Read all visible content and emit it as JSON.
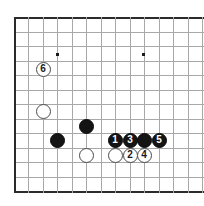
{
  "figure": {
    "name": "go-board-diagram",
    "width": 204,
    "height": 206,
    "background_color": "#ffffff",
    "grid_line_color": "#a8a8a8",
    "border_line_color": "#2b2b2b",
    "black_stone_color": "#141414",
    "white_stone_color": "#ffffff",
    "star_point_color": "#1a1a1a",
    "grid_spacing": 14.5,
    "grid_origin_x": 14,
    "grid_origin_y": 17,
    "columns": 13,
    "rows": 12
  },
  "star_points": [
    {
      "name": "star-point-left",
      "x": 57,
      "y": 54
    },
    {
      "name": "star-point-right",
      "x": 143,
      "y": 54
    }
  ],
  "grid_lines": {
    "horizontal_y": [
      17,
      32,
      46,
      61,
      75,
      90,
      104,
      119,
      133,
      148,
      162,
      177,
      191
    ],
    "vertical_x": [
      14,
      28,
      43,
      57,
      72,
      86,
      101,
      115,
      130,
      144,
      159,
      173,
      188,
      202
    ],
    "edge_horizontal_y": [
      17,
      191
    ],
    "edge_vertical_x": [
      14
    ]
  },
  "stones": [
    {
      "name": "stone-move-6",
      "color": "white",
      "label": "6",
      "x": 43,
      "y": 69,
      "numbered": true
    },
    {
      "name": "stone-white-left",
      "color": "white",
      "label": "",
      "x": 43,
      "y": 111,
      "numbered": false
    },
    {
      "name": "stone-black-left",
      "color": "black",
      "label": "",
      "x": 57,
      "y": 140,
      "numbered": false
    },
    {
      "name": "stone-black-center",
      "color": "black",
      "label": "",
      "x": 86,
      "y": 126,
      "numbered": false
    },
    {
      "name": "stone-white-center",
      "color": "white",
      "label": "",
      "x": 86,
      "y": 155,
      "numbered": false
    },
    {
      "name": "stone-move-1",
      "color": "black",
      "label": "1",
      "x": 115,
      "y": 140,
      "numbered": true
    },
    {
      "name": "stone-move-3",
      "color": "black",
      "label": "3",
      "x": 130,
      "y": 140,
      "numbered": true
    },
    {
      "name": "stone-black-plain-right",
      "color": "black",
      "label": "",
      "x": 144,
      "y": 140,
      "numbered": false
    },
    {
      "name": "stone-move-5",
      "color": "black",
      "label": "5",
      "x": 159,
      "y": 140,
      "numbered": true
    },
    {
      "name": "stone-white-plain-right",
      "color": "white",
      "label": "",
      "x": 115,
      "y": 155,
      "numbered": false
    },
    {
      "name": "stone-move-2",
      "color": "white",
      "label": "2",
      "x": 130,
      "y": 155,
      "numbered": true
    },
    {
      "name": "stone-move-4",
      "color": "white",
      "label": "4",
      "x": 144,
      "y": 155,
      "numbered": true
    }
  ]
}
